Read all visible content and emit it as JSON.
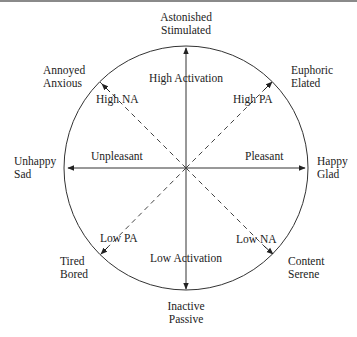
{
  "colors": {
    "line": "#333333",
    "text": "#222222",
    "border": "#8a8a8a"
  },
  "axes": {
    "vertical": {
      "top_label": "High Activation",
      "bottom_label": "Low Activation"
    },
    "horizontal": {
      "left_label": "Unpleasant",
      "right_label": "Pleasant"
    },
    "diag_ne": "High PA",
    "diag_nw": "High NA",
    "diag_sw": "Low PA",
    "diag_se": "Low NA"
  },
  "poles": {
    "top": {
      "line1": "Astonished",
      "line2": "Stimulated"
    },
    "bottom": {
      "line1": "Inactive",
      "line2": "Passive"
    },
    "left": {
      "line1": "Unhappy",
      "line2": "Sad"
    },
    "right": {
      "line1": "Happy",
      "line2": "Glad"
    },
    "ne": {
      "line1": "Euphoric",
      "line2": "Elated"
    },
    "nw": {
      "line1": "Annoyed",
      "line2": "Anxious"
    },
    "sw": {
      "line1": "Tired",
      "line2": "Bored"
    },
    "se": {
      "line1": "Content",
      "line2": "Serene"
    }
  }
}
